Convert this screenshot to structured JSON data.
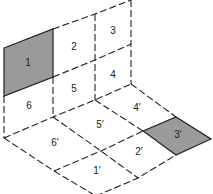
{
  "diagram": {
    "shade_color": "#9a9a9a",
    "wall_panels": [
      {
        "id": "1",
        "label": "1",
        "shaded": true
      },
      {
        "id": "2",
        "label": "2",
        "shaded": false
      },
      {
        "id": "3",
        "label": "3",
        "shaded": false
      },
      {
        "id": "4",
        "label": "4",
        "shaded": false
      },
      {
        "id": "5",
        "label": "5",
        "shaded": false
      },
      {
        "id": "6",
        "label": "6",
        "shaded": false
      }
    ],
    "floor_panels": [
      {
        "id": "1p",
        "label": "1′",
        "shaded": false
      },
      {
        "id": "2p",
        "label": "2′",
        "shaded": false
      },
      {
        "id": "3p",
        "label": "3′",
        "shaded": true
      },
      {
        "id": "4p",
        "label": "4′",
        "shaded": false
      },
      {
        "id": "5p",
        "label": "5′",
        "shaded": false
      },
      {
        "id": "6p",
        "label": "6′",
        "shaded": false
      }
    ]
  }
}
